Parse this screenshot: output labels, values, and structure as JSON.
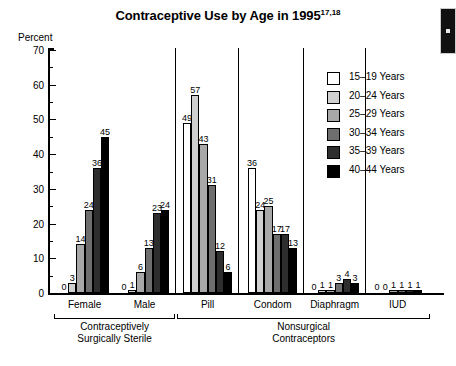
{
  "chart_data": {
    "type": "bar",
    "title": "Contraceptive Use by Age in 1995",
    "title_superscript": "17,18",
    "ylabel": "Percent",
    "xlabel": "",
    "ylim": [
      0,
      70
    ],
    "y_ticks": [
      0,
      10,
      20,
      30,
      40,
      50,
      60,
      70
    ],
    "y_minor_ticks": [
      5,
      15,
      25,
      35,
      45,
      55,
      65
    ],
    "grid": false,
    "legend_position": "top-right",
    "categories": [
      "Female",
      "Male",
      "Pill",
      "Condom",
      "Diaphragm",
      "IUD"
    ],
    "series": [
      {
        "name": "15–19 Years",
        "color": "#ffffff",
        "values": [
          0,
          0,
          49,
          36,
          0,
          0
        ]
      },
      {
        "name": "20–24 Years",
        "color": "#d0d0d0",
        "values": [
          3,
          1,
          57,
          24,
          1,
          0
        ]
      },
      {
        "name": "25–29 Years",
        "color": "#a8a8a8",
        "values": [
          14,
          6,
          43,
          25,
          1,
          1
        ]
      },
      {
        "name": "30–34 Years",
        "color": "#6e6e6e",
        "values": [
          24,
          13,
          31,
          17,
          3,
          1
        ]
      },
      {
        "name": "35–39 Years",
        "color": "#2e2e2e",
        "values": [
          36,
          23,
          12,
          17,
          4,
          1
        ]
      },
      {
        "name": "40–44 Years",
        "color": "#000000",
        "values": [
          45,
          24,
          6,
          13,
          3,
          1
        ]
      }
    ],
    "group_brackets": [
      {
        "label_line1": "Contraceptively",
        "label_line2": "Surgically Sterile",
        "categories": [
          "Female",
          "Male"
        ]
      },
      {
        "label_line1": "Nonsurgical",
        "label_line2": "Contraceptors",
        "categories": [
          "Pill",
          "Condom",
          "Diaphragm",
          "IUD"
        ]
      }
    ]
  },
  "legend": {
    "items": [
      {
        "label": "15–19 Years",
        "color": "#ffffff"
      },
      {
        "label": "20–24 Years",
        "color": "#d0d0d0"
      },
      {
        "label": "25–29 Years",
        "color": "#a8a8a8"
      },
      {
        "label": "30–34 Years",
        "color": "#6e6e6e"
      },
      {
        "label": "35–39 Years",
        "color": "#2e2e2e"
      },
      {
        "label": "40–44 Years",
        "color": "#000000"
      }
    ]
  }
}
